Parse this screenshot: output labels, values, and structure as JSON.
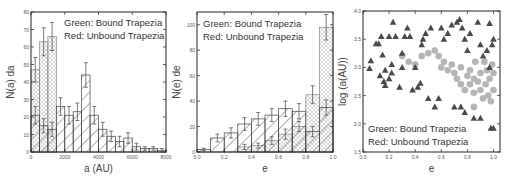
{
  "chart_data": [
    {
      "type": "bar",
      "title": "",
      "xlabel": "a (AU)",
      "ylabel": "N(a) da",
      "xlim": [
        0,
        8000
      ],
      "ylim": [
        0,
        80
      ],
      "xticks": [
        "0",
        "2000",
        "4000",
        "6000",
        "8000"
      ],
      "yticks": [
        "0",
        "10",
        "20",
        "30",
        "40",
        "50",
        "60",
        "70",
        "80"
      ],
      "legend": [
        "Green: Bound Trapezia",
        "Red: Unbound Trapezia"
      ],
      "bin_width": 500,
      "bin_starts": [
        0,
        500,
        1000,
        1500,
        2000,
        2500,
        3000,
        3500,
        4000,
        4500,
        5000,
        5500,
        6000,
        6500,
        7000,
        7500
      ],
      "series": [
        {
          "name": "Bound Trapezia",
          "pattern": "crosshatch",
          "values": [
            47,
            63,
            66,
            0,
            0,
            0,
            0,
            0,
            0,
            0,
            0,
            0,
            0,
            0,
            0,
            0
          ],
          "errors": [
            7,
            8,
            8,
            0,
            0,
            0,
            0,
            0,
            0,
            0,
            0,
            0,
            0,
            0,
            0,
            0
          ]
        },
        {
          "name": "Unbound Trapezia",
          "pattern": "diagonal",
          "values": [
            21,
            15,
            13,
            26,
            21,
            23,
            44,
            21,
            13,
            9,
            6,
            8,
            3,
            2,
            2,
            1
          ],
          "errors": [
            5,
            4,
            4,
            5,
            5,
            5,
            7,
            5,
            4,
            3,
            3,
            3,
            2,
            1,
            1,
            1
          ]
        },
        {
          "name": "Unbound Trapezia (inner)",
          "pattern": "diagonal",
          "values": [
            16,
            12,
            8,
            20,
            8,
            1,
            1,
            0,
            0,
            0,
            0,
            0,
            0,
            0,
            0,
            0
          ]
        }
      ]
    },
    {
      "type": "bar",
      "title": "",
      "xlabel": "e",
      "ylabel": "N(e) de",
      "xlim": [
        0.0,
        1.0
      ],
      "ylim": [
        0,
        110
      ],
      "xticks": [
        "0.0",
        "0.2",
        "0.4",
        "0.6",
        "0.8",
        "1.0"
      ],
      "yticks": [
        "0",
        "20",
        "40",
        "60",
        "80",
        "100"
      ],
      "legend": [
        "Green: Bound Trapezia",
        "Red: Unbound Trapezia"
      ],
      "bin_width": 0.1,
      "bin_starts": [
        0.0,
        0.1,
        0.2,
        0.3,
        0.4,
        0.5,
        0.6,
        0.7,
        0.8,
        0.9
      ],
      "series": [
        {
          "name": "Unbound Trapezia",
          "pattern": "diagonal",
          "values": [
            2,
            11,
            15,
            22,
            26,
            29,
            34,
            32,
            16,
            35
          ],
          "errors": [
            1,
            3,
            4,
            5,
            5,
            5,
            6,
            6,
            4,
            6
          ]
        },
        {
          "name": "Bound Trapezia",
          "pattern": "crosshatch",
          "values": [
            0,
            0,
            0,
            4,
            5,
            9,
            14,
            20,
            45,
            98
          ],
          "errors": [
            0,
            0,
            0,
            2,
            2,
            3,
            4,
            4,
            7,
            10
          ]
        }
      ]
    },
    {
      "type": "scatter",
      "title": "",
      "xlabel": "e",
      "ylabel": "log (a(AU))",
      "xlim": [
        0.0,
        1.05
      ],
      "ylim": [
        1.5,
        4.0
      ],
      "xticks": [
        "0.0",
        "0.2",
        "0.4",
        "0.6",
        "0.8",
        "1.0"
      ],
      "yticks": [
        "1.5",
        "2.0",
        "2.5",
        "3.0",
        "3.5",
        "4.0"
      ],
      "legend": [
        "Green: Bound Trapezia",
        "Red: Unbound Trapezia"
      ],
      "series": [
        {
          "name": "Unbound Trapezia",
          "marker": "triangle",
          "color": "#4a4a4a",
          "points": [
            [
              0.05,
              2.98
            ],
            [
              0.06,
              3.12
            ],
            [
              0.1,
              3.42
            ],
            [
              0.12,
              3.42
            ],
            [
              0.14,
              3.55
            ],
            [
              0.15,
              3.22
            ],
            [
              0.13,
              2.85
            ],
            [
              0.16,
              2.75
            ],
            [
              0.17,
              2.68
            ],
            [
              0.17,
              2.95
            ],
            [
              0.2,
              2.8
            ],
            [
              0.22,
              2.9
            ],
            [
              0.22,
              3.05
            ],
            [
              0.23,
              3.8
            ],
            [
              0.2,
              3.55
            ],
            [
              0.25,
              3.55
            ],
            [
              0.28,
              2.65
            ],
            [
              0.3,
              3.0
            ],
            [
              0.3,
              3.25
            ],
            [
              0.32,
              3.55
            ],
            [
              0.34,
              3.7
            ],
            [
              0.36,
              3.55
            ],
            [
              0.38,
              2.6
            ],
            [
              0.4,
              3.0
            ],
            [
              0.42,
              2.65
            ],
            [
              0.44,
              2.72
            ],
            [
              0.45,
              3.4
            ],
            [
              0.46,
              3.5
            ],
            [
              0.48,
              3.6
            ],
            [
              0.5,
              2.45
            ],
            [
              0.52,
              3.7
            ],
            [
              0.55,
              2.3
            ],
            [
              0.58,
              2.45
            ],
            [
              0.6,
              3.7
            ],
            [
              0.62,
              3.5
            ],
            [
              0.65,
              3.6
            ],
            [
              0.68,
              3.75
            ],
            [
              0.7,
              2.3
            ],
            [
              0.72,
              3.8
            ],
            [
              0.74,
              3.85
            ],
            [
              0.75,
              2.3
            ],
            [
              0.76,
              3.7
            ],
            [
              0.78,
              2.2
            ],
            [
              0.78,
              3.5
            ],
            [
              0.8,
              3.3
            ],
            [
              0.82,
              3.6
            ],
            [
              0.85,
              2.1
            ],
            [
              0.88,
              3.8
            ],
            [
              0.9,
              2.1
            ],
            [
              0.9,
              3.4
            ],
            [
              0.92,
              3.2
            ],
            [
              0.95,
              3.3
            ],
            [
              0.97,
              3.78
            ],
            [
              0.98,
              1.92
            ],
            [
              1.0,
              1.92
            ],
            [
              1.0,
              3.5
            ],
            [
              0.97,
              3.0
            ],
            [
              0.99,
              3.4
            ]
          ]
        },
        {
          "name": "Bound Trapezia",
          "marker": "circle",
          "color": "#b4b4b4",
          "points": [
            [
              0.3,
              3.2
            ],
            [
              0.35,
              3.1
            ],
            [
              0.4,
              3.05
            ],
            [
              0.45,
              3.2
            ],
            [
              0.5,
              3.25
            ],
            [
              0.55,
              3.3
            ],
            [
              0.58,
              3.2
            ],
            [
              0.6,
              3.0
            ],
            [
              0.62,
              3.1
            ],
            [
              0.65,
              2.95
            ],
            [
              0.68,
              3.05
            ],
            [
              0.7,
              2.9
            ],
            [
              0.72,
              2.8
            ],
            [
              0.75,
              3.0
            ],
            [
              0.75,
              2.7
            ],
            [
              0.78,
              2.6
            ],
            [
              0.8,
              2.85
            ],
            [
              0.82,
              2.7
            ],
            [
              0.82,
              2.95
            ],
            [
              0.85,
              2.8
            ],
            [
              0.85,
              2.55
            ],
            [
              0.86,
              3.1
            ],
            [
              0.88,
              2.75
            ],
            [
              0.9,
              2.9
            ],
            [
              0.9,
              2.6
            ],
            [
              0.92,
              2.45
            ],
            [
              0.93,
              3.1
            ],
            [
              0.94,
              2.7
            ],
            [
              0.95,
              2.95
            ],
            [
              0.96,
              2.5
            ],
            [
              0.97,
              2.8
            ],
            [
              0.98,
              2.4
            ],
            [
              0.99,
              3.05
            ],
            [
              1.0,
              2.6
            ],
            [
              1.0,
              2.9
            ],
            [
              0.85,
              2.3
            ]
          ]
        }
      ]
    }
  ]
}
